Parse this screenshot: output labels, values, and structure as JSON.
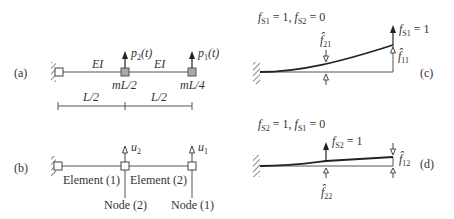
{
  "panel_a": {
    "label": "(a)",
    "ei_left": "EI",
    "ei_right": "EI",
    "mass_mid": "mL/2",
    "mass_end": "mL/4",
    "load_mid": {
      "base": "p",
      "sub": "2",
      "suffix": "(t)"
    },
    "load_end": {
      "base": "p",
      "sub": "1",
      "suffix": "(t)"
    },
    "dim_left": "L/2",
    "dim_right": "L/2"
  },
  "panel_b": {
    "label": "(b)",
    "dof_mid": {
      "base": "u",
      "sub": "2"
    },
    "dof_end": {
      "base": "u",
      "sub": "1"
    },
    "element_1": "Element (1)",
    "element_2": "Element (2)",
    "node_2": "Node (2)",
    "node_1": "Node (1)"
  },
  "panel_c": {
    "label": "(c)",
    "condition": {
      "f1": "f",
      "f1_sub": "S1",
      "f1_val": " = 1, ",
      "f2": "f",
      "f2_sub": "S2",
      "f2_val": " = 0"
    },
    "force": {
      "base": "f",
      "sub": "S1",
      "val": " = 1"
    },
    "k_mid": {
      "base": "f̂",
      "sub": "21"
    },
    "k_end": {
      "base": "f̂",
      "sub": "11"
    }
  },
  "panel_d": {
    "label": "(d)",
    "condition": {
      "f1": "f",
      "f1_sub": "S2",
      "f1_val": " = 1, ",
      "f2": "f",
      "f2_sub": "S1",
      "f2_val": " = 0"
    },
    "force": {
      "base": "f",
      "sub": "S2",
      "val": " = 1"
    },
    "k_end": {
      "base": "f̂",
      "sub": "12"
    },
    "k_mid": {
      "base": "f̂",
      "sub": "22"
    }
  },
  "colors": {
    "line": "#555555",
    "mass": "#aaaaaa",
    "curve": "#222222"
  }
}
